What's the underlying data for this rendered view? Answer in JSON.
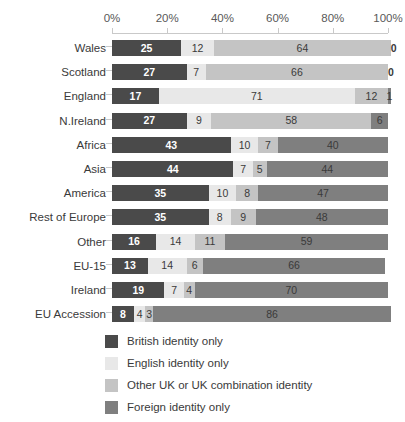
{
  "chart_data": {
    "type": "bar",
    "orientation": "horizontal",
    "stacked": true,
    "stack_mode": "percent",
    "title": "",
    "xlabel": "",
    "ylabel": "",
    "xlim": [
      0,
      100
    ],
    "xticks": [
      "0%",
      "20%",
      "40%",
      "60%",
      "80%",
      "100%"
    ],
    "xtick_values": [
      0,
      20,
      40,
      60,
      80,
      100
    ],
    "grid": false,
    "legend_position": "bottom-left",
    "categories": [
      "Wales",
      "Scotland",
      "England",
      "N.Ireland",
      "Africa",
      "Asia",
      "America",
      "Rest of Europe",
      "Other",
      "EU-15",
      "Ireland",
      "EU Accession"
    ],
    "series": [
      {
        "name": "British identity only",
        "color": "#4a4a4a",
        "values": [
          25,
          27,
          17,
          27,
          43,
          44,
          35,
          35,
          16,
          13,
          19,
          8
        ]
      },
      {
        "name": "English identity only",
        "color": "#e8e8e8",
        "values": [
          12,
          7,
          71,
          9,
          10,
          7,
          10,
          8,
          14,
          14,
          7,
          4
        ]
      },
      {
        "name": "Other UK or UK combination identity",
        "color": "#c4c4c4",
        "values": [
          64,
          66,
          12,
          58,
          7,
          5,
          8,
          9,
          11,
          6,
          4,
          3
        ]
      },
      {
        "name": "Foreign identity only",
        "color": "#7f7f7f",
        "values": [
          0,
          0,
          1,
          6,
          40,
          44,
          47,
          48,
          59,
          66,
          70,
          86
        ]
      }
    ]
  },
  "legend": {
    "items": [
      {
        "label": "British identity only",
        "swatch": "s0"
      },
      {
        "label": "English identity only",
        "swatch": "s1"
      },
      {
        "label": "Other UK or UK combination identity",
        "swatch": "s2"
      },
      {
        "label": "Foreign identity only",
        "swatch": "s3"
      }
    ]
  }
}
